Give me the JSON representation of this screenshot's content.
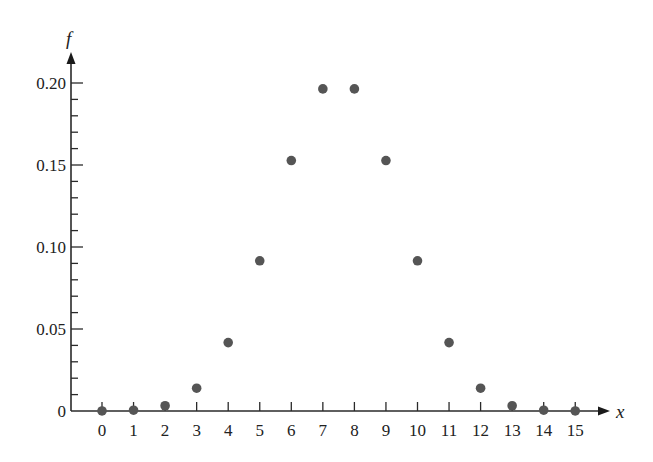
{
  "chart_data": {
    "type": "scatter",
    "title": "",
    "xlabel": "x",
    "ylabel": "f",
    "x": [
      0,
      1,
      2,
      3,
      4,
      5,
      6,
      7,
      8,
      9,
      10,
      11,
      12,
      13,
      14,
      15
    ],
    "values": [
      3e-05,
      0.0005,
      0.0032,
      0.0139,
      0.0417,
      0.0916,
      0.1527,
      0.1964,
      0.1964,
      0.1527,
      0.0916,
      0.0417,
      0.0139,
      0.0032,
      0.0005,
      3e-05
    ],
    "x_ticks": [
      "0",
      "1",
      "2",
      "3",
      "4",
      "5",
      "6",
      "7",
      "8",
      "9",
      "10",
      "11",
      "12",
      "13",
      "14",
      "15"
    ],
    "y_ticks": [
      "0",
      "0.05",
      "0.10",
      "0.15",
      "0.20"
    ],
    "y_tick_values": [
      0,
      0.05,
      0.1,
      0.15,
      0.2
    ],
    "y_minor_tick_step": 0.01,
    "xlim": [
      0,
      15
    ],
    "ylim": [
      0,
      0.21
    ],
    "grid": false,
    "legend": null,
    "point_color": "#555555",
    "axis_color": "#2a2a2a"
  }
}
